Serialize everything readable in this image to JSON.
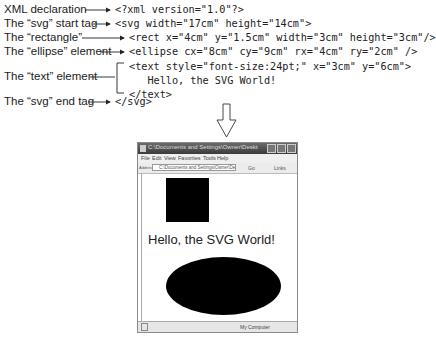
{
  "labels": [
    {
      "text": "XML declaration"
    },
    {
      "text": "The “svg” start tag"
    },
    {
      "text": "The “rectangle”"
    },
    {
      "text": "The “ellipse” element"
    },
    {
      "text": "The “text” element"
    },
    {
      "text": "The “svg” end tag"
    }
  ],
  "code": [
    "<?xml version=\"1.0\"?>",
    "<svg width=\"17cm\" height=\"14cm\">",
    "<rect x=\"4cm\" y=\"1.5cm\" width=\"3cm\" height=\"3cm\"/>",
    "<ellipse cx=\"8cm\" cy=\"9cm\" rx=\"4cm\" ry=\"2cm\" />",
    "<text style=\"font-size:24pt;\" x=\"3cm\" y=\"6cm\">",
    "   Hello, the SVG World!",
    "</text>",
    "</svg>"
  ],
  "browser": {
    "title": "C:\\Documents and Settings\\Owner\\Desktop\\Hello...",
    "menu": [
      "File",
      "Edit",
      "View",
      "Favorites",
      "Tools",
      "Help"
    ],
    "address_label": "Address",
    "address_value": "C:\\Documents and Settings\\Owner\\Desktop\\",
    "go_label": "Go",
    "links_label": "Links",
    "status_zone": "My Computer",
    "rendered_text": "Hello, the SVG World!"
  }
}
